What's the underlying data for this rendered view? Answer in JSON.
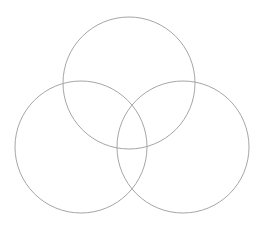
{
  "diagram": {
    "type": "venn",
    "sets": [
      {
        "name": "top"
      },
      {
        "name": "left"
      },
      {
        "name": "right"
      }
    ],
    "stroke_color": "#a6a6a6",
    "background": "#ffffff"
  }
}
